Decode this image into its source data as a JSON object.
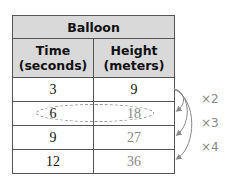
{
  "table": {
    "title": "Balloon",
    "headers": [
      {
        "line1": "Time",
        "line2": "(seconds)"
      },
      {
        "line1": "Height",
        "line2": "(meters)"
      }
    ],
    "rows": [
      {
        "time": "3",
        "height": "9"
      },
      {
        "time": "6",
        "height": "18"
      },
      {
        "time": "9",
        "height": "27"
      },
      {
        "time": "12",
        "height": "36"
      }
    ],
    "highlighted_row_index": 1
  },
  "annotations": {
    "multipliers": [
      "×2",
      "×3",
      "×4"
    ]
  },
  "colors": {
    "header_bg": "#d9d9d9",
    "border": "#555555",
    "annotation_gray": "#888888"
  }
}
